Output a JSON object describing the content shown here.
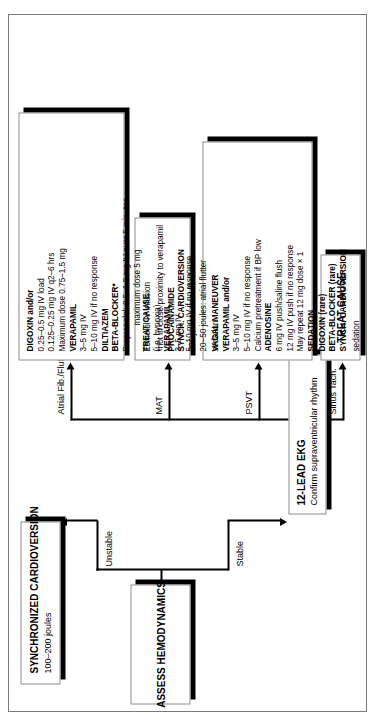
{
  "document": {
    "type": "clinical-algorithm-flowchart",
    "subject": "Supraventricular tachycardia management algorithm",
    "orientation": "rotated-90-counterclockwise"
  },
  "nodes": {
    "assess": {
      "name": "assess-hemodynamics",
      "lines": [
        {
          "text": "ASSESS HEMODYNAMICS",
          "bold": true
        }
      ]
    },
    "cardioversion": {
      "name": "synchronized-cardioversion",
      "lines": [
        {
          "text": "SYNCHRONIZED CARDIOVERSION",
          "bold": true
        },
        {
          "text": "100–200 joules",
          "bold": false
        }
      ]
    },
    "ekg": {
      "name": "twelve-lead-ekg",
      "lines": [
        {
          "text": "12-LEAD EKG",
          "bold": true
        },
        {
          "text": "Confirm supraventricular rhythm",
          "bold": false
        }
      ]
    },
    "sinus_treat": {
      "name": "treat-cause-sinus-tach",
      "lines": [
        {
          "text": "TREAT CAUSE",
          "bold": true
        }
      ]
    },
    "psvt": {
      "name": "psvt-treatment",
      "lines": [
        {
          "text": "VAGAL MANEUVER",
          "bold": true,
          "indent": false
        },
        {
          "text": "VERAPAMIL and/or",
          "bold": true,
          "indent": false
        },
        {
          "text": "3–5 mg IV",
          "bold": false,
          "indent": false
        },
        {
          "text": "5–10 mg IV if no response",
          "bold": false,
          "indent": false
        },
        {
          "text": "Calcium pretreatment if BP low",
          "bold": false,
          "indent": false
        },
        {
          "text": "ADENOSINE",
          "bold": true,
          "indent": false
        },
        {
          "text": "6 mg IV push/saline flush",
          "bold": false,
          "indent": false
        },
        {
          "text": "12 mg IV push if no response",
          "bold": false,
          "indent": false
        },
        {
          "text": "May repeat 12 mg dose × 1",
          "bold": false,
          "indent": false
        },
        {
          "text": "SEDATION",
          "bold": true,
          "indent": false
        },
        {
          "text": "DIGOXIN (rare)",
          "bold": true,
          "indent": false
        },
        {
          "text": "BETA-BLOCKER (rare)",
          "bold": true,
          "indent": false
        },
        {
          "text": "SYNCH. CARDIOVERSION",
          "bold": true,
          "indent": false
        },
        {
          "text": "sedation",
          "bold": false,
          "indent": false
        }
      ]
    },
    "mat": {
      "name": "mat-treatment",
      "lines": [
        {
          "text": "TREAT CAUSE",
          "bold": true
        },
        {
          "text": "(i.e. hypoxia)",
          "bold": false
        },
        {
          "text": "VERAPAMIL",
          "bold": true
        },
        {
          "text": "3–5 mg IV",
          "bold": false
        },
        {
          "text": "5–10 mg IV if no response",
          "bold": false
        }
      ]
    },
    "afib": {
      "name": "atrial-fib-flutter-treatment",
      "lines": [
        {
          "text": "DIGOXIN and/or",
          "bold": true,
          "indent": false
        },
        {
          "text": "0.25–0.5 mg IV load",
          "bold": false,
          "indent": false
        },
        {
          "text": "0.125–0.25 mg IV q2–6 hrs",
          "bold": false,
          "indent": false
        },
        {
          "text": "Maximum dose 0.75–1.5 mg",
          "bold": false,
          "indent": false
        },
        {
          "text": "VERAPAMIL",
          "bold": true,
          "indent": false
        },
        {
          "text": "3–5 mg IV",
          "bold": false,
          "indent": false
        },
        {
          "text": "5–10 mg IV if no response",
          "bold": false,
          "indent": false
        },
        {
          "text": "DILTIAZEM",
          "bold": true,
          "indent": false
        },
        {
          "text": "BETA-BLOCKER*",
          "bold": true,
          "indent": false
        },
        {
          "text": "Propranolol:  0.5–1.0 mg IV over 5 minutes",
          "bold": false,
          "indent": false
        },
        {
          "text": "maximum dose 5 mg",
          "bold": false,
          "indent": true
        },
        {
          "text": "Esmolol IV infusion",
          "bold": false,
          "indent": false
        },
        {
          "text": "*not in close proximity to verapamil",
          "bold": false,
          "indent": false
        },
        {
          "text": "PROCAINAMIDE",
          "bold": true,
          "indent": false
        },
        {
          "text": "SYNCH. CARDIOVERSION",
          "bold": true,
          "indent": false
        },
        {
          "text": "200 joules:  atrial fibrillation",
          "bold": false,
          "indent": false
        },
        {
          "text": "20–50 joules:  atrial flutter",
          "bold": false,
          "indent": false
        },
        {
          "text": "sedation",
          "bold": false,
          "indent": false
        }
      ]
    }
  },
  "edges": {
    "unstable": "Unstable",
    "stable": "Stable",
    "sinus_tach": "Sinus Tach.",
    "psvt": "PSVT",
    "mat": "MAT",
    "atrial_fib_flutter": "Atrial Fib./Flutter"
  },
  "colors": {
    "ink": "#000000",
    "box_border": "#8d8d8d",
    "page_border": "#7a7a7a",
    "background": "#ffffff",
    "shadow": "#000000"
  }
}
